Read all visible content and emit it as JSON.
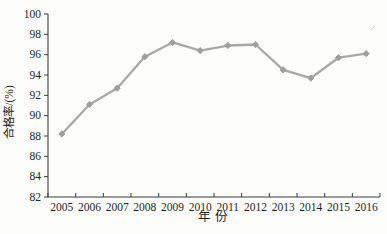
{
  "chart_data": {
    "type": "line",
    "x": [
      2005,
      2006,
      2007,
      2008,
      2009,
      2010,
      2011,
      2012,
      2013,
      2014,
      2015,
      2016
    ],
    "series": [
      {
        "name": "合格率",
        "values": [
          88.2,
          91.1,
          92.7,
          95.8,
          97.2,
          96.4,
          96.9,
          97.0,
          94.5,
          93.7,
          95.7,
          96.1
        ]
      }
    ],
    "title": "",
    "xlabel": "年 份",
    "ylabel": "合格率/(%)",
    "ylim": [
      82,
      100
    ],
    "ytick_step": 2,
    "yticks": [
      82,
      84,
      86,
      88,
      90,
      92,
      94,
      96,
      98,
      100
    ],
    "grid": false,
    "legend_position": "none",
    "line_color": "#a8a8a8",
    "marker": "diamond",
    "marker_color": "#9e9e9e",
    "axis_color": "#3c3c3c",
    "text_color": "#1f1f1f"
  }
}
